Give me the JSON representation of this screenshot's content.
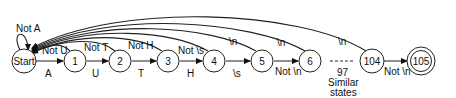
{
  "diagram": {
    "type": "state-machine",
    "nodes": [
      {
        "id": "start",
        "label": "Start",
        "x": 24,
        "y": 61
      },
      {
        "id": "s1",
        "label": "1",
        "x": 75,
        "y": 61
      },
      {
        "id": "s2",
        "label": "2",
        "x": 120,
        "y": 61
      },
      {
        "id": "s3",
        "label": "3",
        "x": 168,
        "y": 61
      },
      {
        "id": "s4",
        "label": "4",
        "x": 214,
        "y": 61
      },
      {
        "id": "s5",
        "label": "5",
        "x": 262,
        "y": 61
      },
      {
        "id": "s6",
        "label": "6",
        "x": 310,
        "y": 61
      },
      {
        "id": "s104",
        "label": "104",
        "x": 372,
        "y": 61
      },
      {
        "id": "s105",
        "label": "105",
        "x": 421,
        "y": 61,
        "accepting": true
      }
    ],
    "forward_edges": [
      {
        "from": "start",
        "to": "s1",
        "label": "A"
      },
      {
        "from": "s1",
        "to": "s2",
        "label": "U"
      },
      {
        "from": "s2",
        "to": "s3",
        "label": "T"
      },
      {
        "from": "s3",
        "to": "s4",
        "label": "H"
      },
      {
        "from": "s4",
        "to": "s5",
        "label": "\\s"
      },
      {
        "from": "s5",
        "to": "s6",
        "label": "Not \\n"
      },
      {
        "from": "s104",
        "to": "s105",
        "label": "Not \\n"
      }
    ],
    "back_edges": [
      {
        "from": "start",
        "to": "start",
        "label": "Not A"
      },
      {
        "from": "s1",
        "to": "start",
        "label": "Not U"
      },
      {
        "from": "s2",
        "to": "start",
        "label": "Not T"
      },
      {
        "from": "s3",
        "to": "start",
        "label": "Not H"
      },
      {
        "from": "s4",
        "to": "start",
        "label": "Not \\s"
      },
      {
        "from": "s5",
        "to": "start",
        "label": "\\n"
      },
      {
        "from": "s6",
        "to": "start",
        "label": "\\n"
      },
      {
        "from": "s104",
        "to": "start",
        "label": "\\n"
      }
    ],
    "ellipsis": {
      "count_label": "97",
      "line1": "Similar",
      "line2": "states"
    }
  }
}
